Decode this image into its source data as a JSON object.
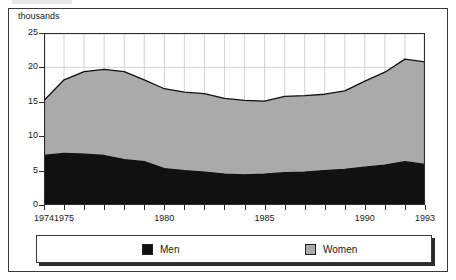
{
  "figure": {
    "axis_unit_label": "thousands"
  },
  "chart_data": {
    "type": "area",
    "stacked": true,
    "title": "",
    "subtitle": "",
    "xlabel": "",
    "ylabel": "thousands",
    "grid": true,
    "legend_position": "bottom",
    "xlim": [
      1974,
      1993
    ],
    "ylim": [
      0,
      25
    ],
    "ytick_labels": [
      "0",
      "5",
      "10",
      "15",
      "20",
      "25"
    ],
    "yticks": [
      0,
      5,
      10,
      15,
      20,
      25
    ],
    "xtick_labels": [
      "1974",
      "1975",
      "1980",
      "1985",
      "1990",
      "1993"
    ],
    "xticks": [
      1974,
      1975,
      1980,
      1985,
      1990,
      1993
    ],
    "x": [
      1974,
      1975,
      1976,
      1977,
      1978,
      1979,
      1980,
      1981,
      1982,
      1983,
      1984,
      1985,
      1986,
      1987,
      1988,
      1989,
      1990,
      1991,
      1992,
      1993
    ],
    "series": [
      {
        "name": "Men",
        "color": "#111111",
        "values": [
          7.2,
          7.5,
          7.4,
          7.2,
          6.6,
          6.3,
          5.3,
          5.0,
          4.8,
          4.5,
          4.4,
          4.5,
          4.7,
          4.8,
          5.0,
          5.2,
          5.5,
          5.8,
          6.3,
          5.9
        ]
      },
      {
        "name": "Women",
        "color": "#aaaaaa",
        "values": [
          8.0,
          10.7,
          12.0,
          12.5,
          12.8,
          11.9,
          11.6,
          11.4,
          11.4,
          11.0,
          10.8,
          10.6,
          11.1,
          11.1,
          11.1,
          11.4,
          12.5,
          13.5,
          14.9,
          14.9
        ]
      }
    ],
    "totals": [
      15.2,
      18.2,
      19.4,
      19.7,
      19.4,
      18.2,
      16.9,
      16.4,
      16.2,
      15.5,
      15.2,
      15.1,
      15.8,
      15.9,
      16.1,
      16.6,
      18.0,
      19.3,
      21.2,
      20.8
    ]
  },
  "legend": {
    "entries": [
      {
        "label": "Men",
        "color": "#111111"
      },
      {
        "label": "Women",
        "color": "#aaaaaa"
      }
    ]
  }
}
